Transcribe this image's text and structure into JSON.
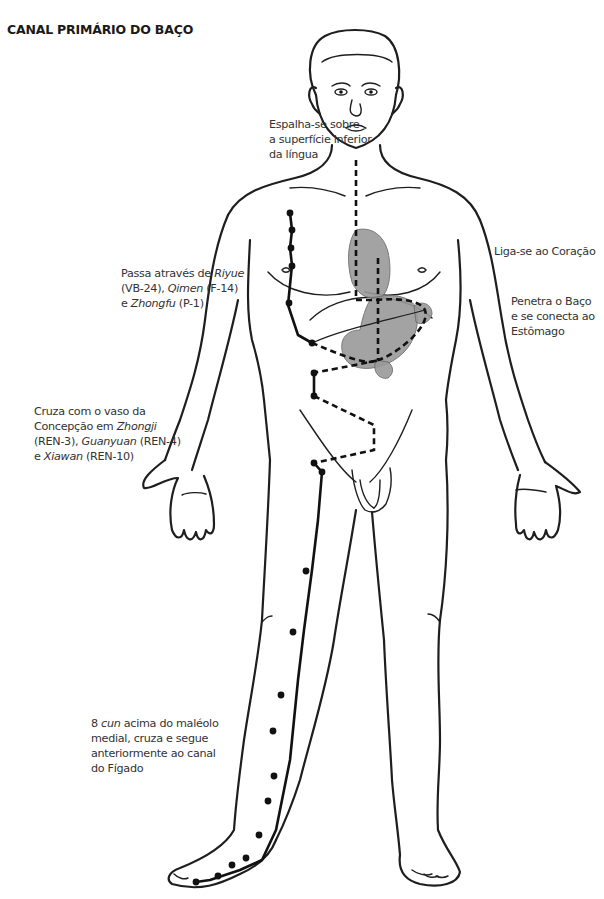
{
  "title": "CANAL PRIMÁRIO DO BAÇO",
  "labels": {
    "tongue": {
      "lines": [
        "Espalha-se sobre",
        "a superfície inferior",
        "da língua"
      ]
    },
    "heart": {
      "lines": [
        "Liga-se ao Coração"
      ]
    },
    "spleen_stomach": {
      "lines": [
        "Penetra o Baço",
        "e se conecta ao",
        "Estômago"
      ]
    },
    "chest_points": {
      "line1_pre": "Passa através de ",
      "line1_em": "Riyue",
      "line2_pre": "(VB-24), ",
      "line2_em": "Qimen",
      "line2_post": " (F-14)",
      "line3_pre": "e ",
      "line3_em": "Zhongfu",
      "line3_post": " (P-1)"
    },
    "conception_vessel": {
      "line1": "Cruza com o vaso da",
      "line2_pre": "Concepção em ",
      "line2_em": "Zhongji",
      "line3_pre": "(REN-3), ",
      "line3_em": "Guanyuan",
      "line3_post": " (REN-4)",
      "line4_pre": "e ",
      "line4_em": "Xiawan",
      "line4_post": " (REN-10)"
    },
    "liver_crossing": {
      "line1_pre": "8 ",
      "line1_em": "cun",
      "line1_post": " acima do maléolo",
      "line2": "medial, cruza e segue",
      "line3": "anteriormente ao canal",
      "line4": "do Fígado"
    }
  },
  "colors": {
    "line": "#1e1e1e",
    "organ_fill": "#9a9a9a",
    "background": "#ffffff"
  },
  "icons": {
    "acupoint": "filled-circle",
    "internal_pathway": "dashed-line",
    "external_pathway": "solid-line"
  }
}
